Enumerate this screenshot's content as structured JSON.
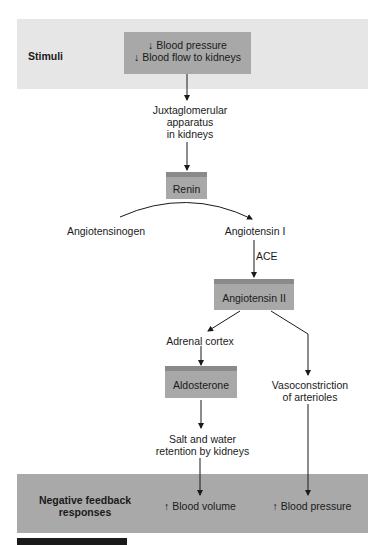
{
  "stimuli_band": {
    "label": "Stimuli",
    "box_lines": [
      "↓ Blood pressure",
      "↓ Blood flow to kidneys"
    ]
  },
  "nodes": {
    "jga": [
      "Juxtaglomerular",
      "apparatus",
      "in kidneys"
    ],
    "renin": "Renin",
    "angiotensinogen": "Angiotensinogen",
    "angiotensin_i": "Angiotensin I",
    "ace": "ACE",
    "angiotensin_ii": "Angiotensin II",
    "adrenal_cortex": "Adrenal cortex",
    "aldosterone": "Aldosterone",
    "vasoconstriction": [
      "Vasoconstriction",
      "of arterioles"
    ],
    "salt_water": [
      "Salt and water",
      "retention by kidneys"
    ]
  },
  "response_band": {
    "label": [
      "Negative feedback",
      "responses"
    ],
    "blood_volume": "↑ Blood volume",
    "blood_pressure": "↑ Blood pressure"
  },
  "colors": {
    "top_band": "#e6e6e6",
    "box_fill": "#a8a8a8",
    "box_edge": "#8a8a8a",
    "bottom_band": "#a9a9a9"
  }
}
